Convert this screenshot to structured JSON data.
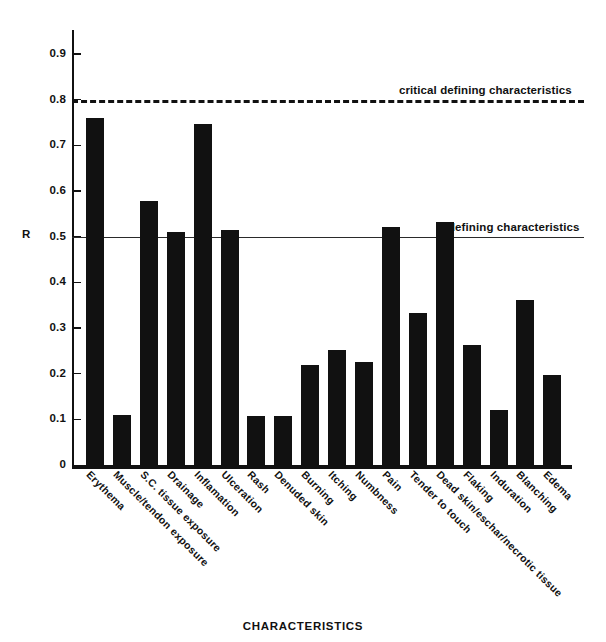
{
  "chart_data": {
    "type": "bar",
    "title": "",
    "xlabel": "CHARACTERISTICS",
    "ylabel": "R",
    "ylim": [
      0,
      0.95
    ],
    "grid": false,
    "legend": "none",
    "bar_color": "#111111",
    "categories": [
      "Erythema",
      "Muscle/tendon exposure",
      "S.C. tissue exposure",
      "Drainage",
      "Inflamation",
      "Ulceration",
      "Rash",
      "Denuded skin",
      "Burning",
      "Itching",
      "Numbness",
      "Pain",
      "Tender to touch",
      "Dead skin/eschar/necrotic tissue",
      "Flaking",
      "Induration",
      "Blanching",
      "Edema"
    ],
    "values": [
      0.762,
      0.112,
      0.581,
      0.513,
      0.749,
      0.516,
      0.11,
      0.11,
      0.222,
      0.255,
      0.228,
      0.524,
      0.334,
      0.535,
      0.265,
      0.123,
      0.364,
      0.199
    ],
    "yticks": [
      0,
      0.1,
      0.2,
      0.3,
      0.4,
      0.5,
      0.6,
      0.7,
      0.8,
      0.9
    ],
    "ytick_labels": [
      "0",
      "0.1",
      "0.2",
      "0.3",
      "0.4",
      "0.5",
      "0.6",
      "0.7",
      "0.8",
      "0.9"
    ],
    "reference_lines": [
      {
        "value": 0.8,
        "style": "dashed",
        "label": "critical defining characteristics"
      },
      {
        "value": 0.5,
        "style": "solid",
        "label": "defining characteristics"
      }
    ]
  }
}
